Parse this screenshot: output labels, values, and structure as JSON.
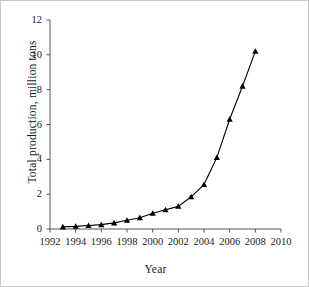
{
  "chart_data": {
    "type": "line",
    "title": "",
    "xlabel": "Year",
    "ylabel": "Total  production, million tons",
    "xlim": [
      1992,
      2010
    ],
    "ylim": [
      0,
      12
    ],
    "xticks": [
      1992,
      1994,
      1996,
      1998,
      2000,
      2002,
      2004,
      2006,
      2008,
      2010
    ],
    "yticks": [
      0,
      2,
      4,
      6,
      8,
      10,
      12
    ],
    "grid": false,
    "legend": false,
    "marker": "triangle-up",
    "marker_color": "#000000",
    "line_color": "#000000",
    "x": [
      1993,
      1994,
      1995,
      1996,
      1997,
      1998,
      1999,
      2000,
      2001,
      2002,
      2003,
      2004,
      2005,
      2006,
      2007,
      2008
    ],
    "values": [
      0.12,
      0.15,
      0.2,
      0.25,
      0.35,
      0.5,
      0.65,
      0.9,
      1.1,
      1.3,
      1.85,
      2.55,
      4.1,
      6.3,
      8.2,
      10.2
    ],
    "series": [
      {
        "name": "Total production",
        "values": [
          0.12,
          0.15,
          0.2,
          0.25,
          0.35,
          0.5,
          0.65,
          0.9,
          1.1,
          1.3,
          1.85,
          2.55,
          4.1,
          6.3,
          8.2,
          10.2
        ]
      }
    ]
  },
  "axes": {
    "y_tick_labels": [
      "12",
      "10",
      "8",
      "6",
      "4",
      "2",
      "0"
    ],
    "x_tick_labels": [
      "1992",
      "1994",
      "1996",
      "1998",
      "2000",
      "2002",
      "2004",
      "2006",
      "2008",
      "2010"
    ],
    "y_title": "Total  production, million tons",
    "x_title": "Year"
  },
  "colors": {
    "axis": "#555555",
    "line": "#000000",
    "marker": "#000000",
    "border": "#c8c8c8",
    "background": "#ffffff"
  }
}
